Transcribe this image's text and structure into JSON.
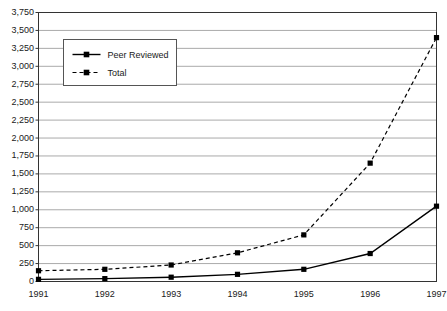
{
  "chart_data": {
    "type": "line",
    "title": "",
    "xlabel": "",
    "ylabel": "",
    "categories": [
      "1991",
      "1992",
      "1993",
      "1994",
      "1995",
      "1996",
      "1997"
    ],
    "x": [
      1991,
      1992,
      1993,
      1994,
      1995,
      1996,
      1997
    ],
    "ylim": [
      0,
      3750
    ],
    "xlim": [
      1991,
      1997
    ],
    "grid": "horizontal",
    "legend_position": "upper-left-inside",
    "y_ticks": [
      0,
      250,
      500,
      750,
      1000,
      1250,
      1500,
      1750,
      2000,
      2250,
      2500,
      2750,
      3000,
      3250,
      3500,
      3750
    ],
    "y_tick_labels": [
      "0",
      "250",
      "500",
      "750",
      "1,000",
      "1,250",
      "1,500",
      "1,750",
      "2,000",
      "2,250",
      "2,500",
      "2,750",
      "3,000",
      "3,250",
      "3,500",
      "3,750"
    ],
    "series": [
      {
        "name": "Peer Reviewed",
        "values": [
          30,
          40,
          60,
          100,
          170,
          390,
          1050
        ],
        "line_style": "solid",
        "marker": "square",
        "color": "#000000"
      },
      {
        "name": "Total",
        "values": [
          150,
          170,
          230,
          400,
          650,
          1650,
          3400
        ],
        "line_style": "dashed",
        "marker": "square",
        "color": "#000000"
      }
    ]
  },
  "legend": {
    "entries": [
      {
        "label": "Peer Reviewed"
      },
      {
        "label": "Total"
      }
    ]
  },
  "colors": {
    "gridline": "#aaaaaa",
    "frame": "#333333",
    "series": "#000000",
    "text": "#1a1a1a",
    "background": "#ffffff"
  }
}
